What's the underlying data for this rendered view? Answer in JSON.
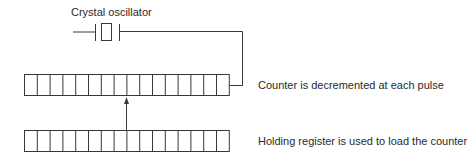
{
  "diagram": {
    "labels": {
      "crystal": "Crystal oscillator",
      "counter": "Counter is decremented at each pulse",
      "holding": "Holding register is used to load the counter"
    },
    "components": {
      "crystal_oscillator": {
        "symbol": "crystal-icon"
      },
      "counter_register": {
        "cells": 16
      },
      "holding_register": {
        "cells": 16
      }
    },
    "connections": [
      {
        "from": "crystal_oscillator",
        "to": "counter_register",
        "type": "wire"
      },
      {
        "from": "holding_register",
        "to": "counter_register",
        "type": "arrow"
      }
    ],
    "colors": {
      "stroke": "#3a3a3a",
      "text": "#2a2a2a",
      "background": "#ffffff"
    }
  }
}
